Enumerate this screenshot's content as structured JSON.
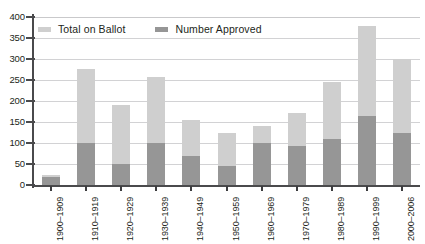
{
  "top_caption": "",
  "footer_caption": "",
  "axes": {
    "y_ticks": [
      "400",
      "350",
      "300",
      "250",
      "200",
      "150",
      "100",
      "50",
      "0"
    ],
    "y_min": 0,
    "y_max": 400,
    "y_step": 50
  },
  "legend": {
    "items": [
      {
        "label": "Total on Ballot",
        "color": "#cfcfcf",
        "swatch_name": "legend-swatch-total-on-ballot"
      },
      {
        "label": "Number Approved",
        "color": "#969696",
        "swatch_name": "legend-swatch-number-approved"
      }
    ]
  },
  "chart_data": {
    "type": "bar",
    "title": "",
    "subtitle": "",
    "xlabel": "",
    "ylabel": "",
    "ylim": [
      0,
      400
    ],
    "ytick_step": 50,
    "grid": true,
    "legend_position": "top-left",
    "stacked": true,
    "categories": [
      "1900–1909",
      "1910–1919",
      "1920–1929",
      "1930–1939",
      "1940–1949",
      "1950–1959",
      "1960–1969",
      "1970–1979",
      "1980–1989",
      "1990–1999",
      "2000–2006"
    ],
    "series": [
      {
        "name": "Total on Ballot",
        "color": "#cfcfcf",
        "values": [
          25,
          276,
          190,
          256,
          155,
          125,
          140,
          172,
          245,
          378,
          300
        ]
      },
      {
        "name": "Number Approved",
        "color": "#969696",
        "values": [
          18,
          100,
          50,
          100,
          68,
          45,
          100,
          92,
          110,
          164,
          124
        ]
      }
    ]
  }
}
